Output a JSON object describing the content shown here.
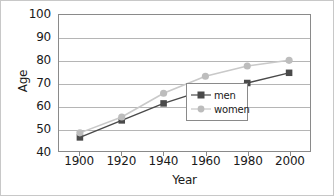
{
  "chart_data": {
    "type": "line",
    "title": "",
    "xlabel": "Year",
    "ylabel": "Age",
    "x": [
      1900,
      1920,
      1940,
      1960,
      1980,
      2000
    ],
    "xticklabels": [
      "1900",
      "1920",
      "1940",
      "1960",
      "1980",
      "2000"
    ],
    "xlim": [
      1890,
      2010
    ],
    "ylim": [
      40,
      100
    ],
    "yticks": [
      40,
      50,
      60,
      70,
      80,
      90,
      100
    ],
    "yticklabels": [
      "40",
      "50",
      "60",
      "70",
      "80",
      "90",
      "100"
    ],
    "grid": "horizontal",
    "legend_position": "lower-right",
    "series": [
      {
        "name": "men",
        "color": "#4a4a4a",
        "marker": "square",
        "values": [
          46,
          53.5,
          61,
          67,
          70,
          74.5
        ]
      },
      {
        "name": "women",
        "color": "#b9b9b9",
        "marker": "circle",
        "values": [
          48,
          55,
          65.5,
          73,
          77.5,
          80
        ]
      }
    ]
  },
  "legend": {
    "entries": [
      {
        "label": "men"
      },
      {
        "label": "women"
      }
    ]
  },
  "colors": {
    "men": "#4a4a4a",
    "women": "#b9b9b9",
    "grid": "#b5b5b5",
    "axis": "#8a8a8a",
    "text": "#1a1a1a",
    "background": "#ffffff"
  }
}
